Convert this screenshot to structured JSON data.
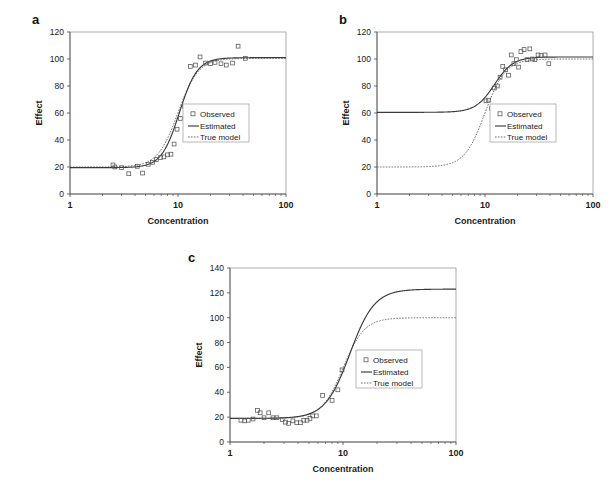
{
  "figure": {
    "panel_letters": [
      "a",
      "b",
      "c"
    ],
    "legend_labels": {
      "observed": "Observed",
      "estimated": "Estimated",
      "true_model": "True model"
    },
    "colors": {
      "estimated": "#3a3a3a",
      "true_model": "#6a6a6a",
      "observed": "#555555",
      "frame": "#9a9a9a",
      "axis": "#5a5a5a",
      "background": "#ffffff"
    }
  },
  "chart_data": [
    {
      "type": "scatter",
      "panel": "a",
      "title": "",
      "xlabel": "Concentration",
      "ylabel": "Effect",
      "xscale": "log",
      "xlim": [
        1,
        100
      ],
      "xticks": [
        1,
        10,
        100
      ],
      "xtick_labels": [
        "1",
        "10",
        "100"
      ],
      "ylim": [
        0,
        120
      ],
      "yticks": [
        0,
        20,
        40,
        60,
        80,
        100,
        120
      ],
      "ytick_labels": [
        "0",
        "20",
        "40",
        "60",
        "80",
        "100",
        "120"
      ],
      "grid": false,
      "legend_position": "center-right",
      "series": [
        {
          "name": "Observed",
          "style": "markers",
          "marker": "open-square",
          "x": [
            2.5,
            2.6,
            3.0,
            3.5,
            4.2,
            4.7,
            5.3,
            5.8,
            6.3,
            6.9,
            7.4,
            8.0,
            8.6,
            9.2,
            9.8,
            10.5,
            11.5,
            13.0,
            14.5,
            16.0,
            18.0,
            20.0,
            22.0,
            25.0,
            28.0,
            32.0,
            36.0,
            42.0
          ],
          "y": [
            21.5,
            20.0,
            19.5,
            15.0,
            20.5,
            15.5,
            22.0,
            23.5,
            25.5,
            27.0,
            27.5,
            29.0,
            29.5,
            37.0,
            48.0,
            56.0,
            65.0,
            94.5,
            95.5,
            101.5,
            97.0,
            96.5,
            97.5,
            96.5,
            95.5,
            97.0,
            109.5,
            100.5
          ]
        },
        {
          "name": "Estimated",
          "style": "line",
          "model": "logistic",
          "bottom": 19.5,
          "top": 101.0,
          "ec50": 10.3,
          "hill": 5.2
        },
        {
          "name": "True model",
          "style": "dashed-line",
          "model": "logistic",
          "bottom": 20.0,
          "top": 100.5,
          "ec50": 10.0,
          "hill": 4.6
        }
      ]
    },
    {
      "type": "scatter",
      "panel": "b",
      "title": "",
      "xlabel": "Concentration",
      "ylabel": "Effect",
      "xscale": "log",
      "xlim": [
        1,
        100
      ],
      "xticks": [
        1,
        10,
        100
      ],
      "xtick_labels": [
        "1",
        "10",
        "100"
      ],
      "ylim": [
        0,
        120
      ],
      "yticks": [
        0,
        20,
        40,
        60,
        80,
        100,
        120
      ],
      "ytick_labels": [
        "0",
        "20",
        "40",
        "60",
        "80",
        "100",
        "120"
      ],
      "grid": false,
      "legend_position": "center-right",
      "series": [
        {
          "name": "Observed",
          "style": "markers",
          "marker": "open-square",
          "x": [
            10.2,
            10.8,
            11.5,
            12.2,
            13.0,
            13.8,
            14.6,
            15.5,
            16.5,
            17.5,
            18.5,
            19.5,
            20.5,
            21.5,
            23.0,
            24.5,
            26.0,
            27.5,
            29.0,
            31.0,
            33.0,
            36.0,
            39.0
          ],
          "y": [
            69.0,
            69.5,
            63.5,
            78.5,
            80.0,
            86.5,
            94.5,
            92.0,
            88.0,
            103.0,
            96.5,
            99.5,
            94.0,
            105.5,
            107.0,
            99.5,
            107.5,
            100.0,
            99.5,
            103.0,
            102.5,
            103.0,
            96.5
          ]
        },
        {
          "name": "Estimated",
          "style": "line",
          "model": "logistic",
          "bottom": 60.5,
          "top": 101.5,
          "ec50": 12.2,
          "hill": 5.0
        },
        {
          "name": "True model",
          "style": "dashed-line",
          "model": "logistic",
          "bottom": 20.0,
          "top": 100.0,
          "ec50": 10.0,
          "hill": 4.6
        }
      ]
    },
    {
      "type": "scatter",
      "panel": "c",
      "title": "",
      "xlabel": "Concentration",
      "ylabel": "Effect",
      "xscale": "log",
      "xlim": [
        1,
        100
      ],
      "xticks": [
        1,
        10,
        100
      ],
      "xtick_labels": [
        "1",
        "10",
        "100"
      ],
      "ylim": [
        0,
        140
      ],
      "yticks": [
        0,
        20,
        40,
        60,
        80,
        100,
        120,
        140
      ],
      "ytick_labels": [
        "0",
        "20",
        "40",
        "60",
        "80",
        "100",
        "120",
        "140"
      ],
      "grid": false,
      "legend_position": "center-right",
      "series": [
        {
          "name": "Observed",
          "style": "markers",
          "marker": "open-square",
          "x": [
            1.25,
            1.35,
            1.45,
            1.6,
            1.75,
            1.85,
            2.0,
            2.2,
            2.4,
            2.6,
            2.9,
            3.1,
            3.3,
            3.6,
            3.9,
            4.2,
            4.5,
            4.8,
            5.1,
            5.4,
            5.8,
            6.6,
            8.0,
            9.0,
            9.8
          ],
          "y": [
            17.5,
            17.0,
            17.5,
            18.5,
            25.5,
            23.5,
            19.5,
            23.5,
            19.5,
            19.5,
            18.0,
            16.0,
            15.0,
            17.0,
            15.5,
            15.5,
            17.5,
            17.5,
            19.0,
            21.0,
            21.0,
            37.5,
            33.5,
            42.0,
            58.0
          ]
        },
        {
          "name": "Estimated",
          "style": "line",
          "model": "logistic",
          "bottom": 19.0,
          "top": 123.0,
          "ec50": 11.5,
          "hill": 4.0
        },
        {
          "name": "True model",
          "style": "dashed-line",
          "model": "logistic",
          "bottom": 19.0,
          "top": 100.0,
          "ec50": 10.0,
          "hill": 4.6
        }
      ]
    }
  ]
}
